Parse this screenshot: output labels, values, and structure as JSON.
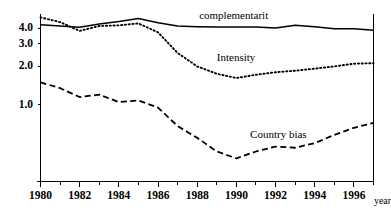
{
  "chart_data": {
    "type": "line",
    "title": "",
    "subtitle": "",
    "xlabel": "year",
    "ylabel": "",
    "yscale": "log",
    "ylim": [
      0.25,
      5.2
    ],
    "xlim": [
      1980,
      1997
    ],
    "grid": false,
    "legend_position": "inline-annotations",
    "y_ticks": [
      4.0,
      3.0,
      2.0,
      1.0
    ],
    "y_tick_labels": [
      "4.0",
      "3.0",
      "2.0",
      "1.0"
    ],
    "x_ticks": [
      1980,
      1982,
      1984,
      1986,
      1988,
      1990,
      1992,
      1994,
      1996
    ],
    "x_tick_labels": [
      "1980",
      "1982",
      "1984",
      "1986",
      "1988",
      "1990",
      "1992",
      "1994",
      "1996"
    ],
    "x_minor_ticks": [
      1981,
      1983,
      1985,
      1987,
      1989,
      1991,
      1993,
      1995,
      1997
    ],
    "x": [
      1980,
      1981,
      1982,
      1983,
      1984,
      1985,
      1986,
      1987,
      1988,
      1989,
      1990,
      1991,
      1992,
      1993,
      1994,
      1995,
      1996,
      1997
    ],
    "series": [
      {
        "name": "complementarit",
        "style": "solid",
        "color": "#000000",
        "label_x": 1988.1,
        "label_y": 5.0,
        "values": [
          4.25,
          4.15,
          4.05,
          4.3,
          4.5,
          4.75,
          4.4,
          4.15,
          4.1,
          4.08,
          4.08,
          4.07,
          4.0,
          4.2,
          4.1,
          3.95,
          3.95,
          3.85
        ]
      },
      {
        "name": "Intensity",
        "style": "dotted",
        "color": "#000000",
        "label_x": 1989.0,
        "label_y": 2.32,
        "values": [
          4.85,
          4.45,
          3.8,
          4.15,
          4.2,
          4.35,
          3.7,
          2.55,
          2.0,
          1.75,
          1.62,
          1.72,
          1.8,
          1.85,
          1.92,
          2.0,
          2.1,
          2.12
        ]
      },
      {
        "name": "Country bias",
        "style": "dashed",
        "color": "#000000",
        "label_x": 1990.7,
        "label_y": 0.58,
        "values": [
          1.5,
          1.35,
          1.15,
          1.2,
          1.05,
          1.08,
          0.95,
          0.68,
          0.55,
          0.43,
          0.38,
          0.43,
          0.47,
          0.46,
          0.5,
          0.58,
          0.66,
          0.72
        ]
      }
    ]
  }
}
